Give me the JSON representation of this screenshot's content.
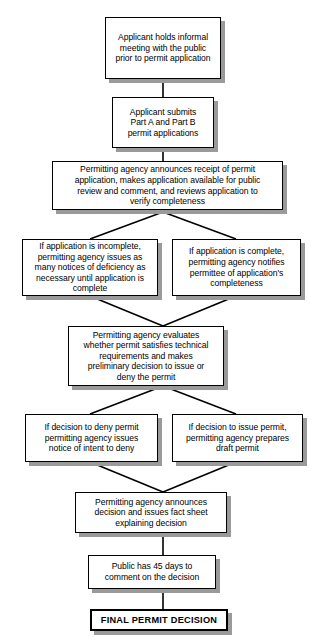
{
  "diagram": {
    "type": "flowchart",
    "orientation": "top-to-bottom",
    "background_color": "#ffffff",
    "box_border_color": "#000000",
    "box_fill_color": "#ffffff",
    "shadow_color": "#9a9a9a",
    "connector_color": "#000000",
    "nodes": [
      {
        "id": "n1",
        "label": "Applicant holds informal\nmeeting with the public\nprior to permit application",
        "shape": "rectangle",
        "emphasis": "normal"
      },
      {
        "id": "n2",
        "label": "Applicant submits\nPart A and Part B\npermit applications",
        "shape": "rectangle",
        "emphasis": "normal"
      },
      {
        "id": "n3",
        "label": "Permitting agency announces receipt of permit\napplication, makes application available for public\nreview and comment, and reviews application to\nverify completeness",
        "shape": "rectangle",
        "emphasis": "normal"
      },
      {
        "id": "n4a",
        "label": "If application is incomplete,\npermitting agency issues as\nmany notices of deficiency as\nnecessary until application is\ncomplete",
        "shape": "rectangle",
        "emphasis": "normal"
      },
      {
        "id": "n4b",
        "label": "If application is complete,\npermitting agency notifies\npermittee of application's\ncompleteness",
        "shape": "rectangle",
        "emphasis": "normal"
      },
      {
        "id": "n5",
        "label": "Permitting agency evaluates\nwhether permit satisfies technical\nrequirements and makes\npreliminary decision to issue or\ndeny the permit",
        "shape": "rectangle",
        "emphasis": "normal"
      },
      {
        "id": "n6a",
        "label": "If decision to deny permit\npermitting agency issues\nnotice of intent to deny",
        "shape": "rectangle",
        "emphasis": "normal"
      },
      {
        "id": "n6b",
        "label": "If decision to issue permit,\npermitting agency prepares\ndraft permit",
        "shape": "rectangle",
        "emphasis": "normal"
      },
      {
        "id": "n7",
        "label": "Permitting agency announces\ndecision and issues fact sheet\nexplaining decision",
        "shape": "rectangle",
        "emphasis": "normal"
      },
      {
        "id": "n8",
        "label": "Public has 45 days to\ncomment on the decision",
        "shape": "rectangle",
        "emphasis": "normal"
      },
      {
        "id": "n9",
        "label": "FINAL PERMIT DECISION",
        "shape": "rectangle",
        "emphasis": "terminal"
      }
    ],
    "edges": [
      {
        "from": "n1",
        "to": "n2",
        "style": "straight"
      },
      {
        "from": "n2",
        "to": "n3",
        "style": "straight"
      },
      {
        "from": "n3",
        "to": "n4a",
        "style": "branch-left"
      },
      {
        "from": "n3",
        "to": "n4b",
        "style": "branch-right"
      },
      {
        "from": "n4a",
        "to": "n5",
        "style": "merge-left"
      },
      {
        "from": "n4b",
        "to": "n5",
        "style": "merge-right"
      },
      {
        "from": "n5",
        "to": "n6a",
        "style": "branch-left"
      },
      {
        "from": "n5",
        "to": "n6b",
        "style": "branch-right"
      },
      {
        "from": "n6a",
        "to": "n7",
        "style": "merge-left"
      },
      {
        "from": "n6b",
        "to": "n7",
        "style": "merge-right"
      },
      {
        "from": "n7",
        "to": "n8",
        "style": "straight"
      },
      {
        "from": "n8",
        "to": "n9",
        "style": "straight"
      }
    ]
  }
}
